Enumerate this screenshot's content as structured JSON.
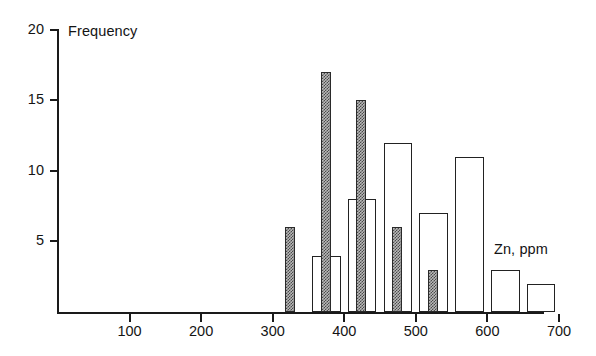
{
  "chart_data": {
    "type": "bar",
    "title": "",
    "xlabel": "Zn, ppm",
    "ylabel": "Frequency",
    "xlim": [
      0,
      700
    ],
    "ylim": [
      0,
      20
    ],
    "grid": false,
    "legend": "none",
    "x_ticks": [
      {
        "value": 100,
        "label": "100"
      },
      {
        "value": 200,
        "label": "200"
      },
      {
        "value": 300,
        "label": "300"
      },
      {
        "value": 400,
        "label": "400"
      },
      {
        "value": 500,
        "label": "500"
      },
      {
        "value": 600,
        "label": "600"
      },
      {
        "value": 700,
        "label": "700"
      }
    ],
    "y_ticks": [
      {
        "value": 5,
        "label": "5"
      },
      {
        "value": 10,
        "label": "10"
      },
      {
        "value": 15,
        "label": "15"
      },
      {
        "value": 20,
        "label": "20"
      }
    ],
    "bin_width": 50,
    "series": [
      {
        "name": "open-histogram",
        "style": "open",
        "bar_width_ppm": 40,
        "bins": [
          {
            "x_center": 375,
            "x_start": 355,
            "x_end": 395,
            "value": 4
          },
          {
            "x_center": 425,
            "x_start": 405,
            "x_end": 445,
            "value": 8
          },
          {
            "x_center": 475,
            "x_start": 455,
            "x_end": 495,
            "value": 12
          },
          {
            "x_center": 525,
            "x_start": 505,
            "x_end": 545,
            "value": 7
          },
          {
            "x_center": 575,
            "x_start": 555,
            "x_end": 595,
            "value": 11
          },
          {
            "x_center": 625,
            "x_start": 605,
            "x_end": 645,
            "value": 3
          },
          {
            "x_center": 675,
            "x_start": 655,
            "x_end": 695,
            "value": 2
          }
        ]
      },
      {
        "name": "shaded-histogram",
        "style": "hatched",
        "bar_width_ppm": 14,
        "bins": [
          {
            "x_center": 324,
            "value": 6
          },
          {
            "x_center": 374,
            "value": 17
          },
          {
            "x_center": 424,
            "value": 15
          },
          {
            "x_center": 474,
            "value": 6
          },
          {
            "x_center": 524,
            "value": 3
          }
        ]
      }
    ]
  },
  "labels": {
    "y_axis_title": "Frequency",
    "x_axis_title": "Zn, ppm"
  }
}
